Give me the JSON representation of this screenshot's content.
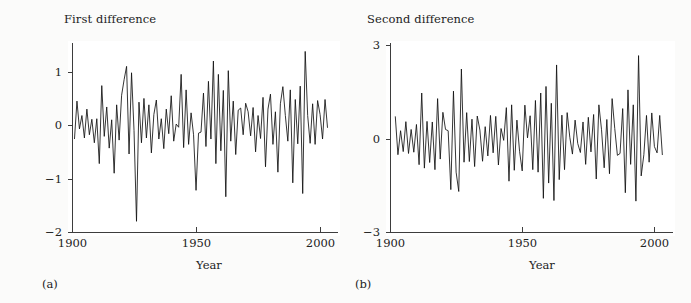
{
  "figure": {
    "background_color": "#fbfbfa",
    "plot_background_color": "#ffffff",
    "line_color": "#111111",
    "axis_color": "#3d3d3d"
  },
  "panels": [
    {
      "caption": "(a)",
      "title": "First difference",
      "xlabel": "Year",
      "ytick_labels": [
        "1",
        "0",
        "−1",
        "−2"
      ],
      "xtick_labels": [
        "1900",
        "1950",
        "2000"
      ]
    },
    {
      "caption": "(b)",
      "title": "Second difference",
      "xlabel": "Year",
      "ytick_labels": [
        "3",
        "0",
        "−3"
      ],
      "xtick_labels": [
        "1900",
        "1950",
        "2000"
      ]
    }
  ],
  "chart_data": [
    {
      "type": "line",
      "title": "First difference",
      "xlabel": "Year",
      "ylabel": "",
      "xlim": [
        1900,
        2004
      ],
      "ylim": [
        -2,
        1.5
      ],
      "xticks": [
        1900,
        1950,
        2000
      ],
      "yticks": [
        1,
        0,
        -1,
        -2
      ],
      "grid": false,
      "legend": "none",
      "x": [
        1901,
        1902,
        1903,
        1904,
        1905,
        1906,
        1907,
        1908,
        1909,
        1910,
        1911,
        1912,
        1913,
        1914,
        1915,
        1916,
        1917,
        1918,
        1919,
        1920,
        1921,
        1922,
        1923,
        1924,
        1925,
        1926,
        1927,
        1928,
        1929,
        1930,
        1931,
        1932,
        1933,
        1934,
        1935,
        1936,
        1937,
        1938,
        1939,
        1940,
        1941,
        1942,
        1943,
        1944,
        1945,
        1946,
        1947,
        1948,
        1949,
        1950,
        1951,
        1952,
        1953,
        1954,
        1955,
        1956,
        1957,
        1958,
        1959,
        1960,
        1961,
        1962,
        1963,
        1964,
        1965,
        1966,
        1967,
        1968,
        1969,
        1970,
        1971,
        1972,
        1973,
        1974,
        1975,
        1976,
        1977,
        1978,
        1979,
        1980,
        1981,
        1982,
        1983,
        1984,
        1985,
        1986,
        1987,
        1988,
        1989,
        1990,
        1991,
        1992,
        1993,
        1994,
        1995,
        1996,
        1997,
        1998,
        1999,
        2000,
        2001,
        2002,
        2003
      ],
      "y": [
        -0.26,
        0.45,
        -0.07,
        0.18,
        -0.24,
        0.3,
        -0.18,
        0.11,
        -0.33,
        0.12,
        -0.72,
        0.74,
        -0.21,
        0.34,
        -0.43,
        0.1,
        -0.9,
        0.38,
        -0.28,
        0.56,
        0.85,
        1.1,
        -0.54,
        0.98,
        -0.1,
        -1.8,
        0.43,
        -0.33,
        0.5,
        -0.24,
        0.38,
        -0.52,
        0.2,
        0.47,
        -0.26,
        0.12,
        -0.44,
        0.3,
        -0.16,
        0.55,
        -0.3,
        0.02,
        -0.04,
        0.95,
        -0.42,
        0.66,
        -0.36,
        0.23,
        -0.18,
        -1.22,
        -0.15,
        -0.13,
        0.6,
        -0.4,
        0.82,
        -0.26,
        1.2,
        -0.72,
        0.95,
        -0.48,
        0.65,
        -1.34,
        1.02,
        -0.3,
        0.45,
        -0.55,
        0.28,
        0.32,
        -0.18,
        0.41,
        0.25,
        -0.2,
        0.33,
        -0.5,
        0.18,
        -0.25,
        0.52,
        -0.78,
        0.3,
        0.58,
        -0.36,
        0.25,
        -0.88,
        0.4,
        0.72,
        0.18,
        -0.3,
        0.66,
        -1.08,
        0.48,
        -0.35,
        0.73,
        -1.28,
        1.38,
        0.18,
        -0.34,
        0.4,
        -0.36,
        0.46,
        0.2,
        -0.26,
        0.48,
        -0.05
      ]
    },
    {
      "type": "line",
      "title": "Second difference",
      "xlabel": "Year",
      "ylabel": "",
      "xlim": [
        1900,
        2004
      ],
      "ylim": [
        -3,
        3
      ],
      "xticks": [
        1900,
        1950,
        2000
      ],
      "yticks": [
        3,
        0,
        -3
      ],
      "grid": false,
      "legend": "none",
      "note": "Differences of the first-difference series (a).",
      "derived_from_panel": 0
    }
  ]
}
